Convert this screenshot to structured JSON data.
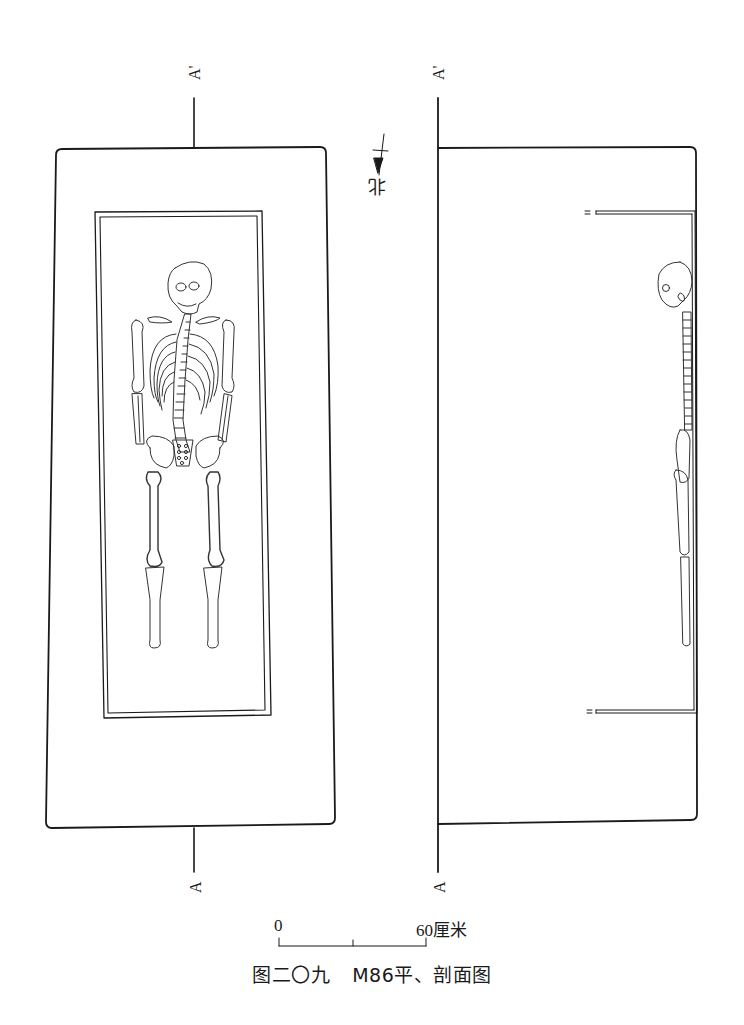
{
  "figure": {
    "caption_number": "图二〇九",
    "caption_title": "M86平、剖面图",
    "north_label": "北",
    "section_markers": {
      "top_label": "A'",
      "bottom_label": "A"
    },
    "scale_bar": {
      "start_label": "0",
      "end_label": "60厘米",
      "divisions": 2
    },
    "panels": [
      {
        "name": "plan-view",
        "description": "Grave plan with coffin and supine skeleton"
      },
      {
        "name": "section-view",
        "description": "Section A-A' showing skeleton in profile"
      }
    ],
    "colors": {
      "line": "#1a1a1a",
      "background": "#ffffff"
    }
  }
}
